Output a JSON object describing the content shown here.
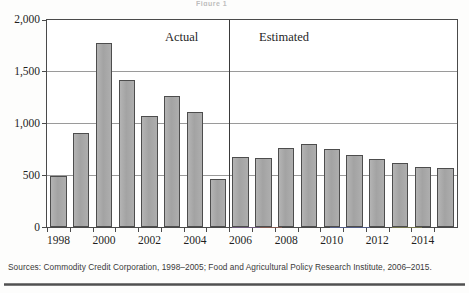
{
  "figure": {
    "title_fragment": "Figure 1",
    "period_labels": {
      "actual": "Actual",
      "estimated": "Estimated"
    },
    "source_note": "Sources: Commodity Credit Corporation, 1998–2005; Food and Agricultural Policy Research Institute, 2006–2015.",
    "colors": {
      "bar_fill": "#a9a9a9",
      "bar_border": "#4d4d4d",
      "axis": "#4a4a4a",
      "gridline": "#9a9a9a",
      "text": "#1f1f1f"
    }
  },
  "chart_data": {
    "type": "bar",
    "title": "Figure 1",
    "xlabel": "",
    "ylabel": "",
    "ylim": [
      0,
      2000
    ],
    "ytick_labels": [
      "0",
      "500",
      "1,000",
      "1,500",
      "2,000"
    ],
    "ytick_values": [
      0,
      500,
      1000,
      1500,
      2000
    ],
    "grid": true,
    "legend": "none",
    "categories": [
      "1998",
      "1999",
      "2000",
      "2001",
      "2002",
      "2003",
      "2004",
      "2005",
      "2006",
      "2007",
      "2008",
      "2009",
      "2010",
      "2011",
      "2012",
      "2013",
      "2014",
      "2015"
    ],
    "xtick_labels": [
      "1998",
      "2000",
      "2002",
      "2004",
      "2006",
      "2008",
      "2010",
      "2012",
      "2014"
    ],
    "values": [
      490,
      910,
      1775,
      1420,
      1075,
      1265,
      1110,
      465,
      680,
      665,
      760,
      800,
      755,
      700,
      660,
      615,
      580,
      570
    ],
    "annotations": [
      {
        "text": "Actual",
        "span": [
          "1998",
          "2005"
        ]
      },
      {
        "text": "Estimated",
        "span": [
          "2006",
          "2015"
        ]
      }
    ],
    "divider_between": [
      "2005",
      "2006"
    ]
  }
}
